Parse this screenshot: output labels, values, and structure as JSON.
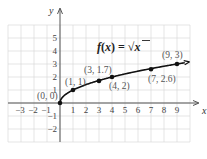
{
  "chart_data": {
    "type": "line",
    "title": "f(x) = √x",
    "function_label": {
      "prefix": "f(x) = ",
      "radical": "√",
      "radicand": "x"
    },
    "xlabel": "x",
    "ylabel": "y",
    "xlim": [
      -4,
      10
    ],
    "ylim": [
      -3,
      6
    ],
    "grid": true,
    "x_ticks": [
      -3,
      -2,
      -1,
      1,
      2,
      3,
      4,
      5,
      6,
      7,
      8,
      9
    ],
    "y_ticks": [
      -2,
      -1,
      1,
      2,
      3,
      4,
      5
    ],
    "x_tick_labels": [
      "−3",
      "−2",
      "−1",
      "1",
      "2",
      "3",
      "4",
      "5",
      "6",
      "7",
      "8",
      "9"
    ],
    "y_tick_labels": [
      "−2",
      "−1",
      "1",
      "2",
      "3",
      "4",
      "5"
    ],
    "series": [
      {
        "name": "f(x) = √x",
        "color": "#111111",
        "points": [
          {
            "x": 0,
            "y": 0,
            "label": "(0, 0)"
          },
          {
            "x": 1,
            "y": 1,
            "label": "(1, 1)"
          },
          {
            "x": 3,
            "y": 1.7,
            "label": "(3, 1.7)"
          },
          {
            "x": 4,
            "y": 2,
            "label": "(4, 2)"
          },
          {
            "x": 7,
            "y": 2.6,
            "label": "(7, 2.6)"
          },
          {
            "x": 9,
            "y": 3,
            "label": "(9, 3)"
          }
        ]
      }
    ]
  },
  "colors": {
    "grid": "#d4d4d4",
    "axis": "#555555",
    "curve": "#111111",
    "label": "#555555"
  }
}
